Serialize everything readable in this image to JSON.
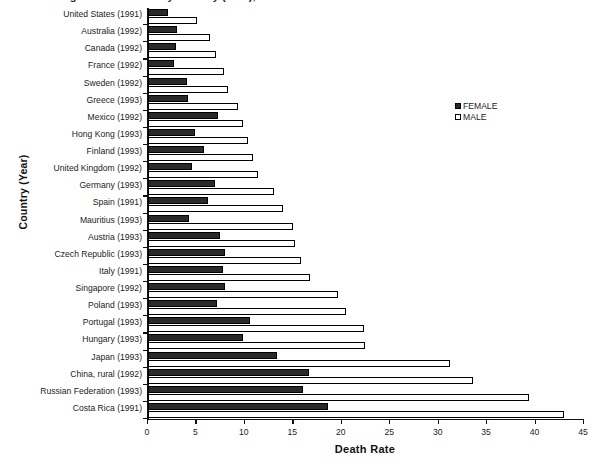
{
  "title": "Figure: Death Rate by Country (Year), Female vs Male",
  "legend": {
    "position": "right",
    "entries": [
      {
        "label": "FEMALE",
        "swatch": "filled-black-square",
        "color": "#2a2a2a"
      },
      {
        "label": "MALE",
        "swatch": "open-white-square",
        "color": "#ffffff"
      }
    ]
  },
  "chart_data": {
    "type": "bar",
    "orientation": "horizontal",
    "title": "Figure: Death Rate by Country (Year), Female vs Male",
    "xlabel": "Death Rate",
    "ylabel": "Country (Year)",
    "xlim": [
      0,
      45
    ],
    "xticks": [
      0,
      5,
      10,
      15,
      20,
      25,
      30,
      35,
      40,
      45
    ],
    "grid": false,
    "legend": [
      "FEMALE",
      "MALE"
    ],
    "categories": [
      "United States (1991)",
      "Australia (1992)",
      "Canada (1992)",
      "France (1992)",
      "Sweden (1992)",
      "Greece (1993)",
      "Mexico (1992)",
      "Hong Kong (1993)",
      "Finland (1993)",
      "United Kingdom (1992)",
      "Germany (1993)",
      "Spain (1991)",
      "Mauritius (1993)",
      "Austria (1993)",
      "Czech Republic (1993)",
      "Italy (1991)",
      "Singapore (1992)",
      "Poland (1993)",
      "Portugal (1993)",
      "Hungary (1993)",
      "Japan (1993)",
      "China, rural (1992)",
      "Russian Federation (1993)",
      "Costa Rica (1991)"
    ],
    "series": [
      {
        "name": "FEMALE",
        "values": [
          2.1,
          3.0,
          2.9,
          2.7,
          4.0,
          4.1,
          7.2,
          4.8,
          5.8,
          4.5,
          6.9,
          6.2,
          4.2,
          7.4,
          7.9,
          7.7,
          7.9,
          7.1,
          10.5,
          9.8,
          13.3,
          16.6,
          16.0,
          18.6
        ]
      },
      {
        "name": "MALE",
        "values": [
          5.1,
          6.4,
          7.0,
          7.8,
          8.3,
          9.3,
          9.8,
          10.3,
          10.8,
          11.4,
          13.0,
          13.9,
          15.0,
          15.2,
          15.8,
          16.7,
          19.6,
          20.4,
          22.3,
          22.4,
          31.2,
          33.5,
          39.3,
          42.9
        ]
      }
    ]
  }
}
